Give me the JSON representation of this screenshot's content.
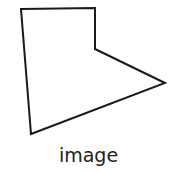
{
  "figure": {
    "shape": "pentagon-polygon",
    "points": "21,9 95,8 95,49 165,83 31,134",
    "stroke": "#1a1a1a",
    "caption": "image"
  }
}
